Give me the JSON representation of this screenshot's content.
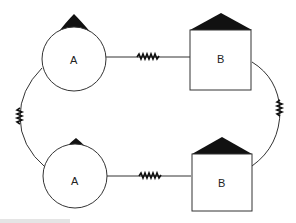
{
  "diagram": {
    "nodes": [
      {
        "id": "a-top",
        "shape": "circle-with-triangle",
        "label": "A"
      },
      {
        "id": "b-top",
        "shape": "square-with-triangle",
        "label": "B"
      },
      {
        "id": "a-bottom",
        "shape": "circle-with-triangle",
        "label": "A"
      },
      {
        "id": "b-bottom",
        "shape": "square-with-triangle",
        "label": "B"
      }
    ],
    "edges": [
      {
        "from": "a-top",
        "to": "b-top",
        "style": "straight-with-zigzag"
      },
      {
        "from": "a-bottom",
        "to": "b-bottom",
        "style": "straight-with-zigzag"
      },
      {
        "from": "a-top",
        "to": "a-bottom",
        "style": "curve-with-zigzag"
      },
      {
        "from": "b-top",
        "to": "b-bottom",
        "style": "curve-with-zigzag"
      }
    ],
    "colors": {
      "stroke": "#333333",
      "fill": "#111111",
      "background": "#ffffff"
    }
  }
}
